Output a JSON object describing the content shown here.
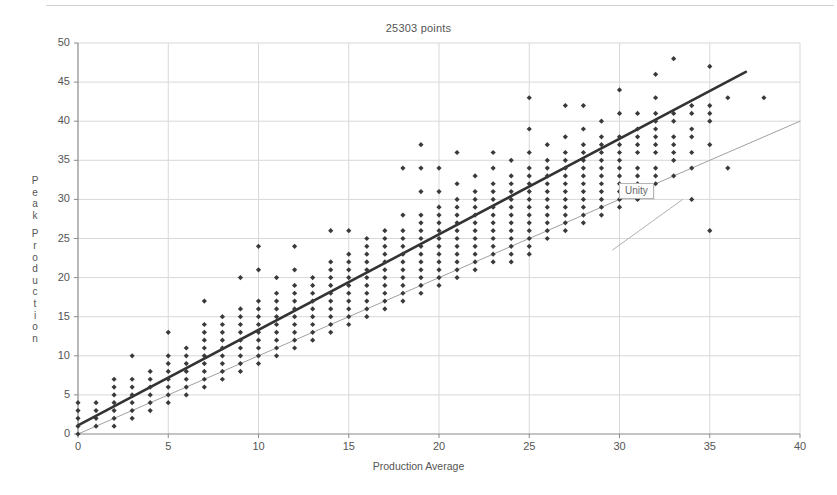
{
  "chart_data": {
    "type": "scatter",
    "title": "25303 points",
    "xlabel": "Production Average",
    "ylabel": "Peak Production",
    "xlim": [
      0,
      40
    ],
    "ylim": [
      0,
      50
    ],
    "xticks": [
      0,
      5,
      10,
      15,
      20,
      25,
      30,
      35,
      40
    ],
    "yticks": [
      0,
      5,
      10,
      15,
      20,
      25,
      30,
      35,
      40,
      45,
      50
    ],
    "grid": true,
    "legend_position": "none",
    "annotations": [
      {
        "label": "Unity",
        "x": 29.6,
        "y": 23.5,
        "leader_to_x": 33.5,
        "leader_to_y": 30.0
      }
    ],
    "series": [
      {
        "name": "data points",
        "marker": "diamond",
        "color": "#3a3a3a",
        "columns": [
          {
            "x": 0,
            "ys": [
              0,
              1,
              2,
              3,
              4
            ]
          },
          {
            "x": 1,
            "ys": [
              1,
              2,
              3,
              4
            ]
          },
          {
            "x": 2,
            "ys": [
              1,
              2,
              3,
              4,
              5,
              6,
              7
            ]
          },
          {
            "x": 3,
            "ys": [
              2,
              3,
              4,
              5,
              6,
              7,
              10
            ]
          },
          {
            "x": 4,
            "ys": [
              3,
              4,
              5,
              6,
              7,
              8
            ]
          },
          {
            "x": 5,
            "ys": [
              4,
              5,
              6,
              7,
              8,
              9,
              10,
              13
            ]
          },
          {
            "x": 6,
            "ys": [
              5,
              6,
              7,
              8,
              9,
              10,
              11
            ]
          },
          {
            "x": 7,
            "ys": [
              6,
              7,
              8,
              9,
              10,
              11,
              12,
              13,
              14,
              17
            ]
          },
          {
            "x": 8,
            "ys": [
              7,
              8,
              9,
              10,
              11,
              12,
              13,
              14,
              15
            ]
          },
          {
            "x": 9,
            "ys": [
              8,
              9,
              10,
              11,
              12,
              13,
              14,
              15,
              16,
              20
            ]
          },
          {
            "x": 10,
            "ys": [
              9,
              10,
              11,
              12,
              13,
              14,
              15,
              16,
              17,
              21,
              24
            ]
          },
          {
            "x": 11,
            "ys": [
              10,
              11,
              12,
              13,
              14,
              15,
              16,
              17,
              18,
              20
            ]
          },
          {
            "x": 12,
            "ys": [
              11,
              12,
              13,
              14,
              15,
              16,
              17,
              18,
              19,
              21,
              24
            ]
          },
          {
            "x": 13,
            "ys": [
              12,
              13,
              14,
              15,
              16,
              17,
              18,
              19,
              20
            ]
          },
          {
            "x": 14,
            "ys": [
              13,
              14,
              15,
              16,
              17,
              18,
              19,
              20,
              21,
              22,
              26
            ]
          },
          {
            "x": 15,
            "ys": [
              14,
              15,
              16,
              17,
              18,
              19,
              20,
              21,
              22,
              23,
              26
            ]
          },
          {
            "x": 16,
            "ys": [
              15,
              16,
              17,
              18,
              19,
              20,
              21,
              22,
              23,
              24,
              25
            ]
          },
          {
            "x": 17,
            "ys": [
              16,
              17,
              18,
              19,
              20,
              21,
              22,
              23,
              24,
              25,
              26
            ]
          },
          {
            "x": 18,
            "ys": [
              17,
              18,
              19,
              20,
              21,
              22,
              23,
              24,
              25,
              26,
              28,
              34
            ]
          },
          {
            "x": 19,
            "ys": [
              18,
              19,
              20,
              21,
              22,
              23,
              24,
              25,
              26,
              27,
              28,
              31,
              34,
              37
            ]
          },
          {
            "x": 20,
            "ys": [
              19,
              20,
              21,
              22,
              23,
              24,
              25,
              26,
              27,
              28,
              29,
              31,
              34
            ]
          },
          {
            "x": 21,
            "ys": [
              20,
              21,
              22,
              23,
              24,
              25,
              26,
              27,
              28,
              29,
              30,
              32,
              36
            ]
          },
          {
            "x": 22,
            "ys": [
              21,
              22,
              23,
              24,
              25,
              26,
              27,
              28,
              29,
              30,
              31,
              33
            ]
          },
          {
            "x": 23,
            "ys": [
              22,
              23,
              24,
              25,
              26,
              27,
              28,
              29,
              30,
              31,
              32,
              34,
              36
            ]
          },
          {
            "x": 24,
            "ys": [
              22,
              23,
              24,
              25,
              26,
              27,
              28,
              29,
              30,
              31,
              32,
              33,
              35
            ]
          },
          {
            "x": 25,
            "ys": [
              23,
              24,
              25,
              26,
              27,
              28,
              29,
              30,
              31,
              32,
              33,
              34,
              36,
              39,
              43
            ]
          },
          {
            "x": 26,
            "ys": [
              25,
              26,
              27,
              28,
              29,
              30,
              31,
              32,
              33,
              34,
              35,
              37
            ]
          },
          {
            "x": 27,
            "ys": [
              26,
              27,
              28,
              29,
              30,
              31,
              32,
              33,
              34,
              35,
              36,
              38,
              42
            ]
          },
          {
            "x": 28,
            "ys": [
              27,
              28,
              29,
              30,
              31,
              32,
              33,
              34,
              35,
              36,
              37,
              39,
              42
            ]
          },
          {
            "x": 29,
            "ys": [
              28,
              29,
              30,
              31,
              32,
              33,
              34,
              35,
              36,
              37,
              38,
              40
            ]
          },
          {
            "x": 30,
            "ys": [
              29,
              30,
              31,
              32,
              33,
              34,
              35,
              36,
              37,
              38,
              41,
              44
            ]
          },
          {
            "x": 31,
            "ys": [
              30,
              31,
              32,
              33,
              34,
              36,
              37,
              38,
              39,
              41
            ]
          },
          {
            "x": 32,
            "ys": [
              32,
              33,
              34,
              36,
              37,
              38,
              39,
              40,
              41,
              43,
              46
            ]
          },
          {
            "x": 33,
            "ys": [
              33,
              35,
              36,
              37,
              38,
              40,
              41,
              48
            ]
          },
          {
            "x": 34,
            "ys": [
              30,
              34,
              36,
              38,
              39,
              41,
              42
            ]
          },
          {
            "x": 35,
            "ys": [
              26,
              37,
              40,
              41,
              42,
              47
            ]
          },
          {
            "x": 36,
            "ys": [
              34,
              43
            ]
          },
          {
            "x": 38,
            "ys": [
              43
            ]
          }
        ]
      },
      {
        "name": "trend line",
        "type": "line",
        "color": "#333333",
        "width": 2.6,
        "from": [
          0,
          1.1
        ],
        "to": [
          37,
          46.3
        ]
      },
      {
        "name": "unity line",
        "type": "line",
        "color": "#a0a0a0",
        "width": 1,
        "from": [
          0,
          0
        ],
        "to": [
          40,
          40
        ]
      }
    ]
  }
}
